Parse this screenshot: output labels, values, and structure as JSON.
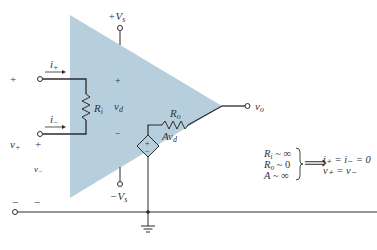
{
  "diagram": {
    "colors": {
      "triangle_fill": "#b7cfdc",
      "line": "#2b2b2b",
      "text": "#333333"
    },
    "supply": {
      "positive": "+V",
      "positive_sub": "s",
      "negative": "−V",
      "negative_sub": "s"
    },
    "inputs": {
      "outer_plus": "+",
      "outer_plus_lower": "+",
      "i_plus": "i",
      "i_plus_sub": "+",
      "i_minus": "i",
      "i_minus_sub": "−",
      "v_plus": "v",
      "v_plus_sub": "+",
      "v_minus": "v",
      "v_minus_sub": "−",
      "minus_left": "−",
      "minus_left2": "−"
    },
    "internal": {
      "ri": "R",
      "ri_sub": "i",
      "vd_plus": "+",
      "vd": "v",
      "vd_sub": "d",
      "vd_minus": "−",
      "ro": "R",
      "ro_sub": "o",
      "source": "Av",
      "source_sub": "d",
      "source_plus": "+",
      "source_minus": "−"
    },
    "output": {
      "vo": "v",
      "vo_sub": "o"
    },
    "conditions": {
      "lines": [
        {
          "var": "R",
          "sub": "i",
          "rel": " ~ ∞"
        },
        {
          "var": "R",
          "sub": "o",
          "rel": " ~ 0"
        },
        {
          "var": "A",
          "sub": "",
          "rel": " ~ ∞"
        }
      ],
      "arrow": "⟹",
      "results": [
        "i₊ = i₋ = 0",
        "v₊ = v₋"
      ]
    }
  }
}
